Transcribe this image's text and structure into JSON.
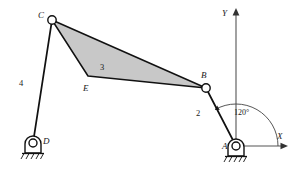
{
  "figure": {
    "kind": "four-bar-linkage-kinematic-diagram",
    "background_color": "#ffffff",
    "line_color": "#111111",
    "body_fill_color": "#c8c8c8",
    "axis_color": "#555555",
    "width": 300,
    "height": 169
  },
  "joints": [
    {
      "id": "C",
      "label": "C",
      "x": 52,
      "y": 20,
      "label_x": 38,
      "label_y": 18,
      "radius": 4.2,
      "type": "revolute-pin"
    },
    {
      "id": "B",
      "label": "B",
      "x": 206,
      "y": 88,
      "label_x": 201,
      "label_y": 78,
      "radius": 4.2,
      "type": "revolute-pin"
    },
    {
      "id": "E",
      "label": "E",
      "x": 88,
      "y": 76,
      "label_x": 83,
      "label_y": 91,
      "radius": 0,
      "type": "body-vertex"
    },
    {
      "id": "A",
      "label": "A",
      "x": 236,
      "y": 146,
      "label_x": 222,
      "label_y": 149,
      "radius": 4.0,
      "type": "grounded-pin"
    },
    {
      "id": "D",
      "label": "D",
      "x": 33,
      "y": 143,
      "label_x": 43,
      "label_y": 144,
      "radius": 4.0,
      "type": "grounded-pin"
    }
  ],
  "links": [
    {
      "id": "link2",
      "number": "2",
      "from": "A",
      "to": "B",
      "label_x": 196,
      "label_y": 116,
      "style": "line"
    },
    {
      "id": "link3",
      "number": "3",
      "vertices": "C,B,E",
      "label_x": 100,
      "label_y": 70,
      "style": "shaded-ternary-body"
    },
    {
      "id": "link4",
      "number": "4",
      "from": "D",
      "to": "C",
      "label_x": 19,
      "label_y": 86,
      "style": "line"
    }
  ],
  "supports": [
    {
      "at": "A",
      "x": 236,
      "y": 146,
      "kind": "fixed-pivot-ground",
      "hatch_count": 5
    },
    {
      "at": "D",
      "x": 33,
      "y": 143,
      "kind": "fixed-pivot-ground",
      "hatch_count": 5
    }
  ],
  "axes": {
    "origin_x": 236,
    "origin_y": 146,
    "x_axis": {
      "label": "X",
      "label_x": 277,
      "label_y": 139,
      "end_x": 287,
      "end_y": 146
    },
    "y_axis": {
      "label": "Y",
      "label_x": 222,
      "label_y": 16,
      "end_x": 236,
      "end_y": 9
    }
  },
  "annotations": [
    {
      "id": "crank-angle",
      "text": "120°",
      "label_x": 234,
      "label_y": 115,
      "value": 120,
      "unit": "degrees",
      "measured_from": "X",
      "measured_to": "link2",
      "arc_radius": 42
    }
  ]
}
